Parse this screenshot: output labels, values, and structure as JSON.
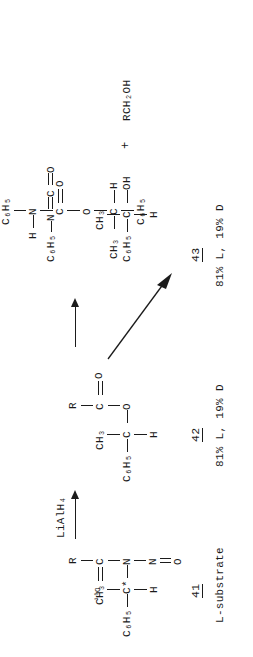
{
  "figure": {
    "kind": "chemical-reaction-scheme",
    "orientation": "rotated-90-ccw",
    "ink_color": "#1b1b1b",
    "background_color": "#ffffff"
  },
  "substrate": {
    "id_label": "41",
    "caption": "L-substrate",
    "atoms": {
      "c6h5": "C₆H₅",
      "ch3": "CH₃",
      "c_star": "C*",
      "h": "H",
      "n": "N",
      "c": "C",
      "o18": "¹⁸O",
      "r": "R",
      "n_nitroso": "N",
      "o_nitroso": "O"
    },
    "formula_text": "C6H5-C*(CH3)(H)-N(N=O)-C(=18O)-R"
  },
  "reagent": {
    "label": "LiAlH₄",
    "arrow": "up-arrow"
  },
  "ester": {
    "id_label": "42",
    "stereo_note": "81% L, 19% D",
    "atoms": {
      "c6h5": "C₆H₅",
      "ch3": "CH₃",
      "c": "C",
      "h": "H",
      "o_ester": "O",
      "c_carbonyl": "C",
      "o_carbonyl": "O",
      "r": "R"
    },
    "formula_text": "C6H5-C(CH3)(H)-O-C(=O)-R"
  },
  "alcohol_product": {
    "id_label": "43",
    "stereo_note": "81% L, 19% D",
    "atoms": {
      "c6h5": "C₆H₅",
      "ch3": "CH₃",
      "c": "C",
      "h": "H",
      "oh": "OH"
    },
    "plus": "+",
    "coproduct": "RCH₂OH",
    "formula_text": "C6H5-C(CH3)(H)-OH + RCH2OH"
  },
  "isocyanate": {
    "text_left": "C₆H₅",
    "n": "N",
    "c": "C",
    "o": "O",
    "formula_text": "C6H5-N=C=O"
  },
  "carbamate": {
    "atoms": {
      "h": "H",
      "n": "N",
      "c6h5_on_n": "C₆H₅",
      "c_carbonyl": "C",
      "o_carbonyl": "O",
      "o_ester": "O",
      "ch3": "CH₃",
      "c": "C",
      "h_on_c": "H",
      "c6h5": "C₆H₅"
    },
    "formula_text": "C6H5-C(CH3)(H)-O-C(=O)-N(H)-C6H5"
  },
  "diagonal_arrow": {
    "name": "conversion-arrow",
    "direction": "down-right"
  }
}
